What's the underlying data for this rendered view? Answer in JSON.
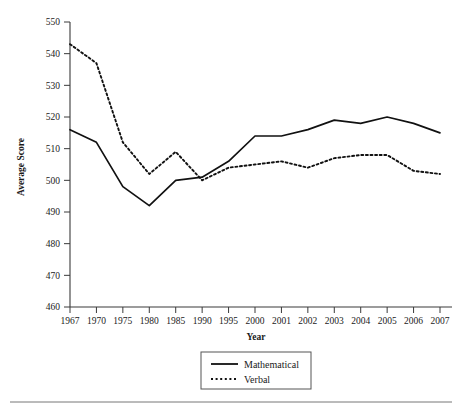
{
  "chart_data": {
    "type": "line",
    "title": "",
    "xlabel": "Year",
    "ylabel": "Average Score",
    "categories": [
      "1967",
      "1970",
      "1975",
      "1980",
      "1985",
      "1990",
      "1995",
      "2000",
      "2001",
      "2002",
      "2003",
      "2004",
      "2005",
      "2006",
      "2007"
    ],
    "ylim": [
      460,
      550
    ],
    "ytick_labels": [
      "550",
      "540",
      "530",
      "520",
      "510",
      "500",
      "490",
      "480",
      "470",
      "460"
    ],
    "yticks": [
      550,
      540,
      530,
      520,
      510,
      500,
      490,
      480,
      470,
      460
    ],
    "grid": false,
    "legend_position": "bottom-center",
    "series": [
      {
        "name": "Mathematical",
        "style": "solid",
        "color": "#111111",
        "values": [
          516,
          512,
          498,
          492,
          500,
          501,
          506,
          514,
          514,
          516,
          519,
          518,
          520,
          518,
          515
        ]
      },
      {
        "name": "Verbal",
        "style": "dotted",
        "color": "#111111",
        "values": [
          543,
          537,
          512,
          502,
          509,
          500,
          504,
          505,
          506,
          504,
          507,
          508,
          508,
          503,
          502
        ]
      }
    ]
  },
  "legend": {
    "items": [
      {
        "label": "Mathematical",
        "style": "solid"
      },
      {
        "label": "Verbal",
        "style": "dotted"
      }
    ]
  },
  "caption": {
    "text": ""
  }
}
